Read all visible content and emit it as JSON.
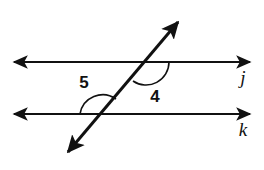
{
  "figure": {
    "background_color": "#ffffff",
    "stroke_color": "#111111",
    "width": 264,
    "height": 170
  },
  "lines": [
    {
      "id": "line-j",
      "label": "j",
      "label_x": 243,
      "label_y": 84,
      "x1": 14,
      "y1": 62,
      "x2": 250,
      "y2": 62,
      "arrow_start": true,
      "arrow_end": true,
      "stroke_width": 2.2
    },
    {
      "id": "line-k",
      "label": "k",
      "label_x": 243,
      "label_y": 136,
      "x1": 14,
      "y1": 114,
      "x2": 250,
      "y2": 114,
      "arrow_start": true,
      "arrow_end": true,
      "stroke_width": 2.2
    },
    {
      "id": "transversal",
      "label": "",
      "label_x": 0,
      "label_y": 0,
      "x1": 68,
      "y1": 152,
      "x2": 178,
      "y2": 22,
      "arrow_start": true,
      "arrow_end": true,
      "stroke_width": 3.0
    }
  ],
  "intersections": [
    {
      "id": "intersection-j",
      "x": 146,
      "y": 62
    },
    {
      "id": "intersection-k",
      "x": 103,
      "y": 114
    }
  ],
  "angles": [
    {
      "id": "angle-5",
      "label": "5",
      "label_x": 84,
      "label_y": 88,
      "vertex_x": 103,
      "vertex_y": 114,
      "radius": 23,
      "arc_path": "M 80 114 A 23 23 0 0 1 116 99",
      "arc_stroke_width": 1.6
    },
    {
      "id": "angle-4",
      "label": "4",
      "label_x": 155,
      "label_y": 102,
      "vertex_x": 146,
      "vertex_y": 62,
      "radius": 23,
      "arc_path": "M 133 81 A 23 23 0 0 0 169 62",
      "arc_stroke_width": 1.6
    }
  ]
}
